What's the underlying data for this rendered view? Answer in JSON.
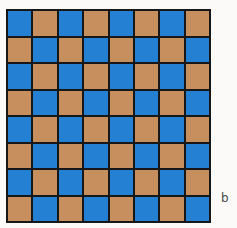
{
  "figure": {
    "panel_label": "b",
    "colors": {
      "dark_square": "#2480d2",
      "light_square": "#c78f5d",
      "grid_line": "#171717",
      "background": "#fbfaf8",
      "label_color": "#4a4a4a"
    }
  },
  "chart_data": {
    "type": "heatmap",
    "title": "",
    "subtitle": "",
    "xlabel": "",
    "ylabel": "",
    "rows": 8,
    "cols": 8,
    "grid": true,
    "legend": "none",
    "annotations": [
      "b"
    ],
    "categories": [
      "1",
      "2",
      "3",
      "4",
      "5",
      "6",
      "7",
      "8"
    ],
    "value_labels": {
      "1": "blue",
      "0": "tan"
    },
    "values": [
      [
        1,
        0,
        1,
        0,
        1,
        0,
        1,
        0
      ],
      [
        0,
        1,
        0,
        1,
        0,
        1,
        0,
        1
      ],
      [
        1,
        0,
        1,
        0,
        1,
        0,
        1,
        0
      ],
      [
        0,
        1,
        0,
        1,
        0,
        1,
        0,
        1
      ],
      [
        1,
        0,
        1,
        0,
        1,
        0,
        1,
        0
      ],
      [
        0,
        1,
        0,
        1,
        0,
        1,
        0,
        1
      ],
      [
        1,
        0,
        1,
        0,
        1,
        0,
        1,
        0
      ],
      [
        0,
        1,
        0,
        1,
        0,
        1,
        0,
        1
      ]
    ]
  }
}
